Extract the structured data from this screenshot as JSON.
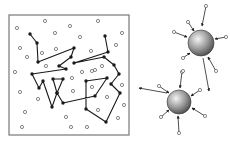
{
  "panels": {
    "left": {
      "label": "polymer-chain-box",
      "box": {
        "x": 9,
        "y": 15,
        "w": 120,
        "h": 120
      },
      "chain": [
        [
          30,
          34
        ],
        [
          37,
          43
        ],
        [
          38,
          62
        ],
        [
          74,
          48
        ],
        [
          71,
          57
        ],
        [
          59,
          66
        ],
        [
          66,
          69
        ],
        [
          32,
          74
        ],
        [
          39,
          88
        ],
        [
          43,
          81
        ],
        [
          52,
          107
        ],
        [
          57,
          93
        ],
        [
          53,
          79
        ],
        [
          63,
          79
        ],
        [
          57,
          93
        ],
        [
          63,
          103
        ],
        [
          95,
          96
        ],
        [
          107,
          78
        ],
        [
          86,
          81
        ],
        [
          86,
          109
        ],
        [
          106,
          122
        ],
        [
          120,
          93
        ],
        [
          111,
          84
        ],
        [
          119,
          74
        ],
        [
          114,
          65
        ],
        [
          104,
          57
        ],
        [
          74,
          63
        ],
        [
          108,
          52
        ],
        [
          105,
          36
        ]
      ],
      "free_particles": [
        [
          17,
          28
        ],
        [
          45,
          21
        ],
        [
          70,
          26
        ],
        [
          98,
          21
        ],
        [
          122,
          33
        ],
        [
          55,
          33
        ],
        [
          80,
          37
        ],
        [
          20,
          48
        ],
        [
          27,
          57
        ],
        [
          42,
          53
        ],
        [
          56,
          49
        ],
        [
          91,
          51
        ],
        [
          116,
          45
        ],
        [
          46,
          66
        ],
        [
          95,
          70
        ],
        [
          15,
          72
        ],
        [
          82,
          72
        ],
        [
          92,
          71
        ],
        [
          102,
          66
        ],
        [
          72,
          78
        ],
        [
          92,
          87
        ],
        [
          122,
          85
        ],
        [
          20,
          92
        ],
        [
          38,
          99
        ],
        [
          73,
          91
        ],
        [
          107,
          97
        ],
        [
          124,
          105
        ],
        [
          25,
          112
        ],
        [
          98,
          110
        ],
        [
          66,
          117
        ],
        [
          118,
          118
        ],
        [
          22,
          127
        ],
        [
          71,
          127
        ],
        [
          87,
          127
        ]
      ]
    },
    "right": {
      "label": "colloid-spheres",
      "spheres": [
        {
          "cx": 201,
          "cy": 43,
          "r": 13,
          "arrows": [
            {
              "from": [
                206,
                6
              ],
              "to": [
                202,
                26
              ],
              "particle": true
            },
            {
              "from": [
                188,
                22
              ],
              "to": [
                194,
                31
              ],
              "particle": true
            },
            {
              "from": [
                174,
                32
              ],
              "to": [
                187,
                37
              ],
              "particle": true
            },
            {
              "from": [
                226,
                37
              ],
              "to": [
                215,
                39
              ],
              "particle": true
            },
            {
              "from": [
                183,
                58
              ],
              "to": [
                190,
                53
              ],
              "particle": true
            },
            {
              "from": [
                216,
                71
              ],
              "to": [
                208,
                57
              ],
              "particle": true
            },
            {
              "from": [
                203,
                58
              ],
              "to": [
                209,
                91
              ],
              "particle": false
            }
          ]
        },
        {
          "cx": 179,
          "cy": 102,
          "r": 12,
          "arrows": [
            {
              "from": [
                182,
                72
              ],
              "to": [
                180,
                88
              ],
              "particle": true
            },
            {
              "from": [
                159,
                86
              ],
              "to": [
                169,
                93
              ],
              "particle": true
            },
            {
              "from": [
                200,
                90
              ],
              "to": [
                191,
                96
              ],
              "particle": true
            },
            {
              "from": [
                167,
                93
              ],
              "to": [
                139,
                88
              ],
              "particle": false
            },
            {
              "from": [
                161,
                117
              ],
              "to": [
                169,
                110
              ],
              "particle": true
            },
            {
              "from": [
                205,
                116
              ],
              "to": [
                192,
                108
              ],
              "particle": true
            },
            {
              "from": [
                179,
                133
              ],
              "to": [
                178,
                116
              ],
              "particle": true
            }
          ]
        }
      ],
      "loose_particles": [
        [
          183,
          71
        ]
      ]
    }
  },
  "colors": {
    "line": "#1a1a1a",
    "particle_stroke": "#555555",
    "box_border": "#777777",
    "sphere_light": "#f2f2f2",
    "sphere_dark": "#5a5a5a"
  }
}
